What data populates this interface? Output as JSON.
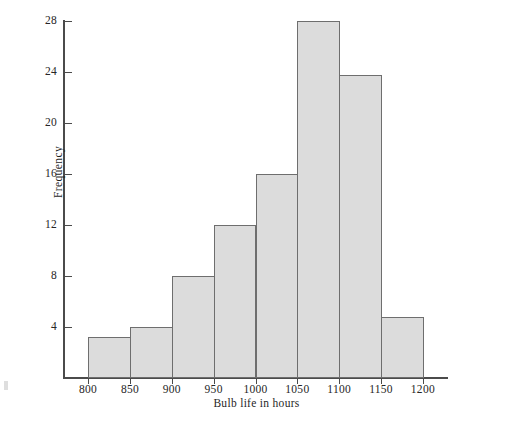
{
  "chart_data": {
    "type": "bar",
    "title": "",
    "subtitle": "",
    "xlabel": "Bulb life in hours",
    "ylabel": "Frequency",
    "bin_width": 50,
    "bin_edges": [
      800,
      850,
      900,
      950,
      1000,
      1050,
      1100,
      1150,
      1200
    ],
    "categories": [
      "800-850",
      "850-900",
      "900-950",
      "950-1000",
      "1000-1050",
      "1050-1100",
      "1100-1150",
      "1150-1200"
    ],
    "values": [
      3.2,
      4,
      8,
      12,
      16,
      28,
      23.8,
      4.8
    ],
    "xticks": [
      800,
      850,
      900,
      950,
      1000,
      1050,
      1100,
      1150,
      1200
    ],
    "xtick_labels": [
      "800",
      "850",
      "900",
      "950",
      "1000",
      "1050",
      "1100",
      "1150",
      "1200"
    ],
    "yticks": [
      4,
      8,
      12,
      16,
      20,
      24,
      28
    ],
    "ytick_labels": [
      "4",
      "8",
      "12",
      "16",
      "20",
      "24",
      "28"
    ],
    "xlim": [
      770,
      1230
    ],
    "ylim": [
      0,
      29.6
    ],
    "grid": false,
    "legend": null,
    "bar_fill_color": "#dcdcdc",
    "bar_edge_color": "#6e6e6e",
    "axis_color": "#4b4b4b",
    "background_color": "#ffffff"
  }
}
